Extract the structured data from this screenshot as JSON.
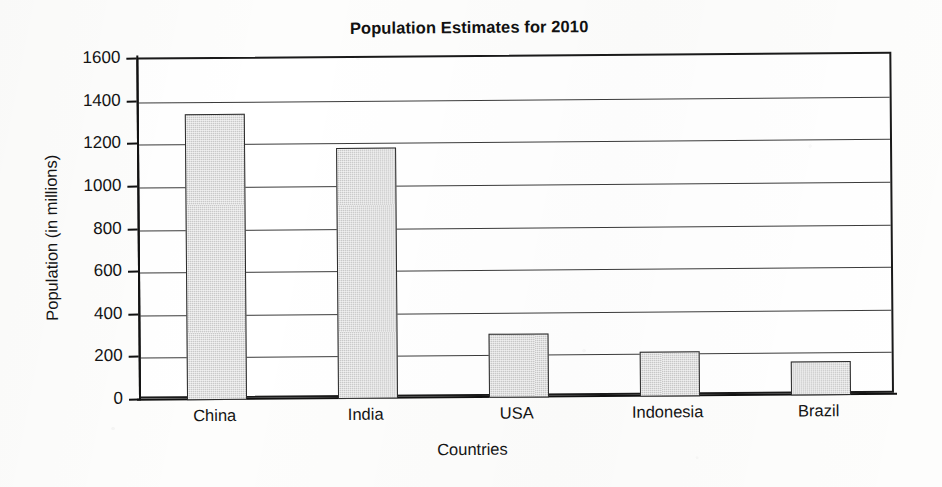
{
  "chart_data": {
    "type": "bar",
    "title": "Population Estimates for 2010",
    "xlabel": "Countries",
    "ylabel": "Population (in millions)",
    "categories": [
      "China",
      "India",
      "USA",
      "Indonesia",
      "Brazil"
    ],
    "values": [
      1340,
      1180,
      300,
      210,
      160
    ],
    "ylim": [
      0,
      1600
    ],
    "ytick_labels": [
      "1600",
      "1400",
      "1200",
      "1000",
      "800",
      "600",
      "400",
      "200",
      "0"
    ],
    "ytick_values": [
      1600,
      1400,
      1200,
      1000,
      800,
      600,
      400,
      200,
      0
    ],
    "ytick_step": 200,
    "grid": true,
    "grid_axis": "y",
    "legend": false,
    "legend_position": "none",
    "bar_fill_color": "#c9c9c9",
    "bar_edge_color": "#2b2b2b",
    "axis_color": "#111111",
    "background_color": "#ffffff",
    "series": [
      {
        "name": "Population 2010",
        "values": [
          1340,
          1180,
          300,
          210,
          160
        ]
      }
    ]
  }
}
